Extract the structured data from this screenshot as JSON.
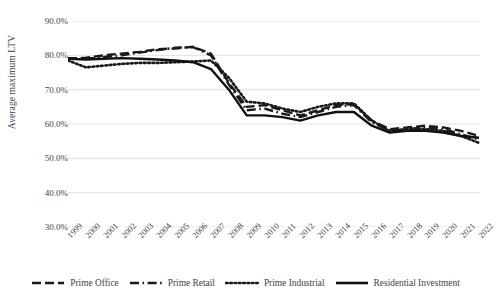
{
  "chart_data": {
    "type": "line",
    "title": "",
    "xlabel": "",
    "ylabel": "Average maximum LTV",
    "x": [
      1999,
      2000,
      2001,
      2002,
      2003,
      2004,
      2005,
      2006,
      2007,
      2008,
      2009,
      2010,
      2011,
      2012,
      2013,
      2014,
      2015,
      2016,
      2017,
      2018,
      2019,
      2020,
      2021,
      2022
    ],
    "categories": [
      "1999",
      "2000",
      "2001",
      "2002",
      "2003",
      "2004",
      "2005",
      "2006",
      "2007",
      "2008",
      "2009",
      "2010",
      "2011",
      "2012",
      "2013",
      "2014",
      "2015",
      "2016",
      "2017",
      "2018",
      "2019",
      "2020",
      "2021",
      "2022"
    ],
    "ylim": [
      30.0,
      90.0
    ],
    "yticks": [
      30.0,
      40.0,
      50.0,
      60.0,
      70.0,
      80.0,
      90.0
    ],
    "ytick_labels": [
      "30.0%",
      "40.0%",
      "50.0%",
      "60.0%",
      "70.0%",
      "80.0%",
      "90.0%"
    ],
    "grid": true,
    "grid_axis": "y",
    "legend_position": "bottom",
    "series": [
      {
        "name": "Prime Office",
        "style": "dashed",
        "color": "#1a1a1a",
        "values": [
          79.0,
          79.3,
          80.0,
          80.5,
          81.0,
          81.8,
          82.0,
          82.5,
          80.5,
          72.0,
          65.0,
          65.5,
          64.0,
          62.5,
          64.0,
          65.5,
          65.8,
          61.0,
          58.5,
          59.0,
          59.5,
          59.0,
          58.0,
          56.5
        ]
      },
      {
        "name": "Prime Retail",
        "style": "dashdot",
        "color": "#1a1a1a",
        "values": [
          79.2,
          79.0,
          79.5,
          80.0,
          80.8,
          81.5,
          82.2,
          82.4,
          80.0,
          71.5,
          64.0,
          64.5,
          63.0,
          62.0,
          63.5,
          65.0,
          65.5,
          60.5,
          58.0,
          58.5,
          59.0,
          58.5,
          57.0,
          55.5
        ]
      },
      {
        "name": "Prime Industrial",
        "style": "dotted",
        "color": "#1a1a1a",
        "values": [
          78.5,
          76.5,
          77.0,
          77.5,
          77.8,
          77.8,
          78.0,
          78.2,
          78.5,
          73.5,
          66.5,
          66.0,
          64.5,
          63.5,
          65.0,
          66.0,
          66.0,
          61.0,
          58.0,
          58.5,
          58.5,
          58.0,
          56.5,
          54.5
        ]
      },
      {
        "name": "Residential Investment",
        "style": "solid",
        "color": "#111111",
        "values": [
          79.0,
          78.8,
          79.0,
          79.2,
          79.0,
          78.8,
          78.5,
          78.0,
          76.0,
          70.0,
          62.5,
          62.5,
          62.0,
          61.0,
          62.5,
          63.5,
          63.5,
          59.5,
          57.5,
          58.0,
          58.0,
          57.5,
          56.5,
          56.0
        ]
      }
    ]
  },
  "axis": {
    "y_title": "Average maximum LTV"
  },
  "legend": {
    "items": [
      {
        "label": "Prime Office",
        "swatch": "dashed-line-swatch"
      },
      {
        "label": "Prime Retail",
        "swatch": "dashdot-line-swatch"
      },
      {
        "label": "Prime Industrial",
        "swatch": "dotted-line-swatch"
      },
      {
        "label": "Residential Investment",
        "swatch": "solid-line-swatch"
      }
    ]
  }
}
